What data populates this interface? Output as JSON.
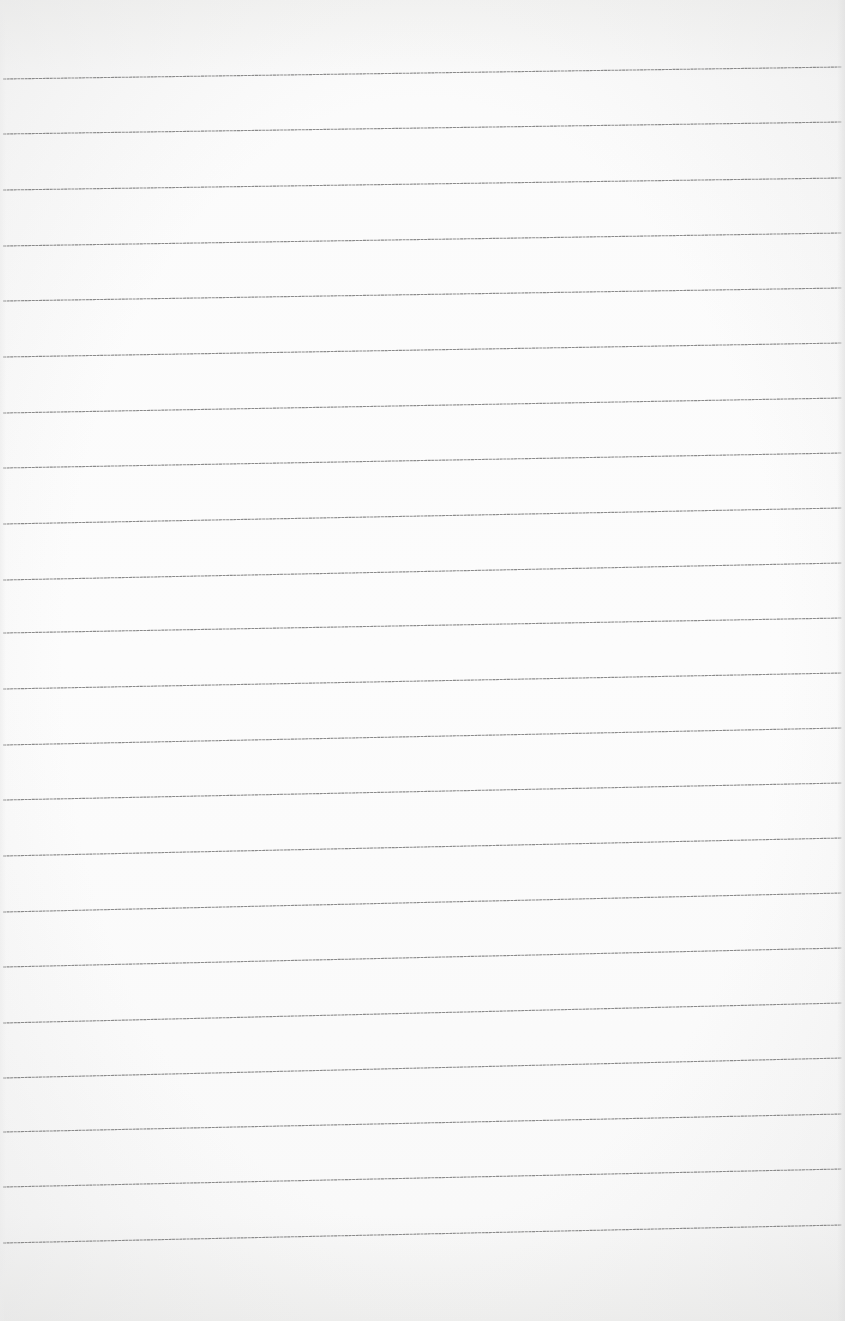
{
  "page": {
    "type": "blank-ruled-paper",
    "background_color": "#fbfbfb",
    "rule_color": "#8a8a8a",
    "rule_count": 22,
    "rules": [
      {
        "y_left": 79,
        "y_right": 67
      },
      {
        "y_left": 134,
        "y_right": 122
      },
      {
        "y_left": 190,
        "y_right": 178
      },
      {
        "y_left": 246,
        "y_right": 233
      },
      {
        "y_left": 301,
        "y_right": 288
      },
      {
        "y_left": 357,
        "y_right": 343
      },
      {
        "y_left": 413,
        "y_right": 398
      },
      {
        "y_left": 468,
        "y_right": 453
      },
      {
        "y_left": 524,
        "y_right": 508
      },
      {
        "y_left": 580,
        "y_right": 563
      },
      {
        "y_left": 633,
        "y_right": 618
      },
      {
        "y_left": 689,
        "y_right": 673
      },
      {
        "y_left": 745,
        "y_right": 728
      },
      {
        "y_left": 800,
        "y_right": 783
      },
      {
        "y_left": 856,
        "y_right": 838
      },
      {
        "y_left": 912,
        "y_right": 893
      },
      {
        "y_left": 967,
        "y_right": 948
      },
      {
        "y_left": 1023,
        "y_right": 1003
      },
      {
        "y_left": 1078,
        "y_right": 1058
      },
      {
        "y_left": 1132,
        "y_right": 1114
      },
      {
        "y_left": 1187,
        "y_right": 1169
      },
      {
        "y_left": 1243,
        "y_right": 1225
      }
    ]
  }
}
